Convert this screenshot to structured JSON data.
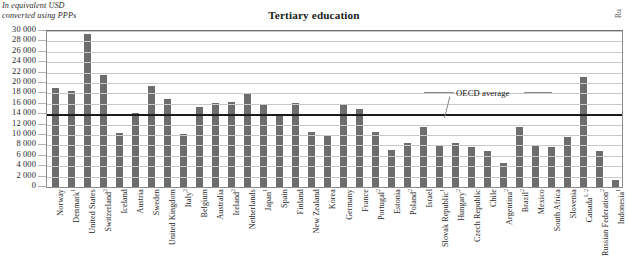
{
  "unit_note": {
    "line1": "In equivalent USD",
    "line2": "converted using PPPs"
  },
  "edge_clip_text": "Ru",
  "chart_data": {
    "type": "bar",
    "title": "Tertiary education",
    "subtitle": "In equivalent USD converted using PPPs",
    "xlabel": "",
    "ylabel": "",
    "ylim": [
      0,
      30000
    ],
    "ytick_step": 2000,
    "grid": true,
    "legend": "none",
    "y_ticks": [
      "30 000",
      "28 000",
      "26 000",
      "24 000",
      "22 000",
      "20 000",
      "18 000",
      "16 000",
      "14 000",
      "12 000",
      "10 000",
      "8 000",
      "6 000",
      "4 000",
      "2 000",
      "0"
    ],
    "y_tick_values": [
      30000,
      28000,
      26000,
      24000,
      22000,
      20000,
      18000,
      16000,
      14000,
      12000,
      10000,
      8000,
      6000,
      4000,
      2000,
      0
    ],
    "reference_line": {
      "label": "OECD average",
      "value": 13958
    },
    "bar_color": "#6d6d6d",
    "categories": [
      "Norway",
      "Denmark",
      "United States",
      "Switzerland",
      "Iceland",
      "Austria",
      "Sweden",
      "United Kingdom",
      "Italy",
      "Belgium",
      "Australia",
      "Ireland",
      "Netherlands",
      "Japan",
      "Spain",
      "Finland",
      "New Zealand",
      "Korea",
      "Germany",
      "France",
      "Portugal",
      "Estonia",
      "Poland",
      "Israel",
      "Slovak Republic",
      "Hungary",
      "Czech Republic",
      "Chile",
      "Argentina",
      "Brazil",
      "Mexico",
      "South Africa",
      "Slovenia",
      "Canada",
      "Russian Federation",
      "Indonesia"
    ],
    "category_notes": [
      "",
      "1",
      "",
      "2",
      "",
      "",
      "",
      "",
      "2",
      "",
      "",
      "2",
      "",
      "1",
      "",
      "",
      "",
      "",
      "",
      "",
      "2",
      "",
      "2",
      "",
      "1",
      "2",
      "",
      "",
      "2",
      "2",
      "",
      "",
      "",
      "1, 2",
      "2",
      "1"
    ],
    "values": [
      19000,
      18500,
      29500,
      21600,
      10400,
      14300,
      19500,
      17000,
      10100,
      15400,
      16100,
      16300,
      17800,
      15900,
      13900,
      16100,
      10500,
      9900,
      15700,
      15000,
      10600,
      7100,
      8400,
      11600,
      8000,
      8400,
      7600,
      6900,
      4700,
      11500,
      8100,
      7600,
      9700,
      21100,
      7000,
      1300
    ]
  }
}
